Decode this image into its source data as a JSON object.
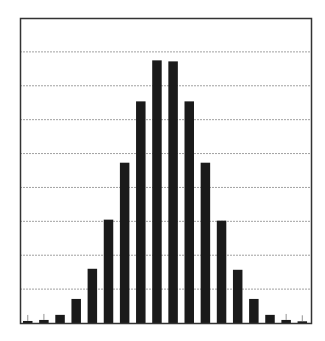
{
  "chart_data": {
    "type": "bar",
    "title": "",
    "xlabel": "",
    "ylabel": "",
    "categories": [
      "1",
      "2",
      "3",
      "4",
      "5",
      "6",
      "7",
      "8",
      "9",
      "10",
      "11",
      "12",
      "13",
      "14",
      "15",
      "16",
      "17",
      "18"
    ],
    "values": [
      0.06,
      0.09,
      0.24,
      0.71,
      1.6,
      3.05,
      4.73,
      6.54,
      7.75,
      7.72,
      6.54,
      4.73,
      3.02,
      1.57,
      0.71,
      0.24,
      0.09,
      0.05
    ],
    "ylim": [
      0,
      9
    ],
    "grid": {
      "horizontal": true,
      "style": "dashed",
      "lines": 8
    },
    "tick_labels_visible": false,
    "legend": null,
    "bar_color": "#1a1a1a",
    "frame_color": "#333333",
    "grid_color": "#8a8a8a",
    "error_ticks_on_bars": [
      1,
      2,
      17,
      18
    ]
  },
  "caption": {
    "text": ""
  }
}
